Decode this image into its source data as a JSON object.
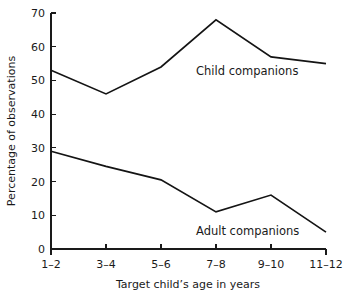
{
  "chart_data": {
    "type": "line",
    "title": "",
    "xlabel": "Target child’s age in years",
    "ylabel": "Percentage of observations",
    "categories": [
      "1–2",
      "3–4",
      "5–6",
      "7–8",
      "9–10",
      "11–12"
    ],
    "xlim": [
      0,
      5
    ],
    "ylim": [
      0,
      70
    ],
    "yticks": [
      0,
      10,
      20,
      30,
      40,
      50,
      60,
      70
    ],
    "ytick_labels": [
      "0",
      "10",
      "20",
      "30",
      "40",
      "50",
      "60",
      "70"
    ],
    "grid": false,
    "legend_position": "inline-annotations",
    "series": [
      {
        "name": "Child companions",
        "values": [
          53,
          46,
          54,
          68,
          57,
          55
        ],
        "color": "#141414",
        "annotation": "Child companions"
      },
      {
        "name": "Adult companions",
        "values": [
          29,
          24.5,
          20.5,
          11,
          16,
          5
        ],
        "color": "#141414",
        "annotation": "Adult companions"
      }
    ],
    "annotations": [
      {
        "text": "Child companions",
        "x_px": 196,
        "y_px": 75
      },
      {
        "text": "Adult companions",
        "x_px": 196,
        "y_px": 235
      }
    ]
  }
}
